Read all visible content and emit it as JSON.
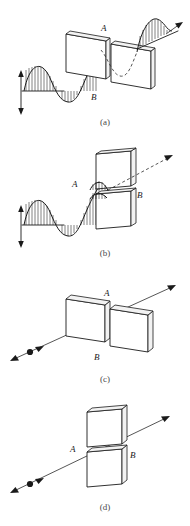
{
  "figure": {
    "title": "",
    "background_color": "#ffffff",
    "ink_color": "#1a1a1a",
    "panels": [
      {
        "id": "a",
        "caption": "(a)",
        "labels": {
          "plate_a": "A",
          "plate_b": "B"
        },
        "description": "Vertically polarized wave passes through two aligned polarizer plates and exits as a vertically polarized wave",
        "incoming_wave": "hatched-sine-wave",
        "outgoing_wave": "hatched-sine-wave",
        "double_arrow": "vertical-double-arrow",
        "plate_arrangement": "side-by-side",
        "transmitted": "yes"
      },
      {
        "id": "b",
        "caption": "(b)",
        "labels": {
          "plate_a": "A",
          "plate_b": "B"
        },
        "description": "Vertically polarized wave is blocked by crossed polarizer plates; only a dashed ray continues",
        "incoming_wave": "hatched-sine-wave",
        "outgoing_wave": "dashed-ray",
        "double_arrow": "vertical-double-arrow",
        "plate_arrangement": "stacked-vertical",
        "transmitted": "no"
      },
      {
        "id": "c",
        "caption": "(c)",
        "labels": {
          "plate_a": "A",
          "plate_b": "B"
        },
        "description": "Ray with polarization marker passes through two aligned plates",
        "incoming_wave": "ray-with-dot-marker",
        "outgoing_wave": "ray-arrow",
        "double_arrow": "ray-double-arrow",
        "plate_arrangement": "side-by-side",
        "transmitted": "yes"
      },
      {
        "id": "d",
        "caption": "(d)",
        "labels": {
          "plate_a": "A",
          "plate_b": "B"
        },
        "description": "Ray with polarization marker passes between stacked plates",
        "incoming_wave": "ray-with-dot-marker",
        "outgoing_wave": "ray-arrow",
        "double_arrow": "ray-double-arrow",
        "plate_arrangement": "stacked-vertical",
        "transmitted": "yes"
      }
    ]
  },
  "captions": {
    "a": "(a)",
    "b": "(b)",
    "c": "(c)",
    "d": "(d)"
  },
  "labels": {
    "a_top": "A",
    "a_bottom": "B",
    "b_left": "A",
    "b_right": "B",
    "c_top": "A",
    "c_bottom": "B",
    "d_left": "A",
    "d_right": "B"
  }
}
